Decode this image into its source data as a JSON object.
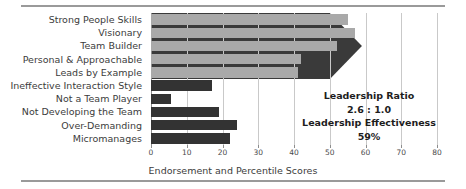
{
  "chart_data": {
    "type": "bar",
    "orientation": "horizontal",
    "title": "",
    "xlabel": "Endorsement and Percentile Scores",
    "ylabel": "",
    "xlim": [
      0,
      80
    ],
    "xticks": [
      0,
      10,
      20,
      30,
      40,
      50,
      60,
      70,
      80
    ],
    "grid": true,
    "legend": "none",
    "categories": [
      "Strong People Skills",
      "Visionary",
      "Team Builder",
      "Personal & Approachable",
      "Leads by Example",
      "Ineffective Interaction Style",
      "Not a Team Player",
      "Not Developing the Team",
      "Over-Demanding",
      "Micromanages"
    ],
    "values": [
      55,
      57,
      52,
      42,
      41,
      17,
      5.5,
      19,
      24,
      22
    ],
    "bar_groups": [
      {
        "name": "strengths",
        "indices": [
          0,
          1,
          2,
          3,
          4
        ],
        "color": "#a9a9a9"
      },
      {
        "name": "derailers",
        "indices": [
          5,
          6,
          7,
          8,
          9
        ],
        "color": "#333333"
      }
    ],
    "annotations": [
      {
        "name": "arrow-callout",
        "shape": "right-arrow",
        "color": "#3a3a3a",
        "spans_rows": [
          0,
          4
        ],
        "tip_value": 59
      }
    ]
  },
  "axis": {
    "tick_labels": [
      "0",
      "10",
      "20",
      "30",
      "40",
      "50",
      "60",
      "70",
      "80"
    ],
    "x_axis_title": "Endorsement and Percentile Scores"
  },
  "callout": {
    "ratio_label": "Leadership Ratio",
    "ratio_value": "2.6 : 1.0",
    "effectiveness_label": "Leadership Effectiveness",
    "effectiveness_value": "59%"
  },
  "colors": {
    "bar_light": "#a9a9a9",
    "bar_dark": "#333333",
    "arrow": "#3a3a3a",
    "grid": "#c9c9c9",
    "rule": "#9a9a9a",
    "text": "#3c3c3c"
  }
}
